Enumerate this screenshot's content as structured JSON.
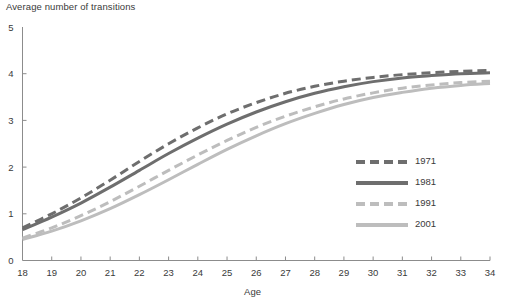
{
  "chart_data": {
    "type": "line",
    "title": "",
    "ylabel": "Average number of transitions",
    "xlabel": "Age",
    "xlim": [
      18,
      34
    ],
    "ylim": [
      0,
      5
    ],
    "grid": false,
    "legend_position": "right-middle",
    "x": [
      18,
      19,
      20,
      21,
      22,
      23,
      24,
      25,
      26,
      27,
      28,
      29,
      30,
      31,
      32,
      33,
      34
    ],
    "y_ticks": [
      "0",
      "1",
      "2",
      "3",
      "4",
      "5"
    ],
    "x_ticks": [
      "18",
      "19",
      "20",
      "21",
      "22",
      "23",
      "24",
      "25",
      "26",
      "27",
      "28",
      "29",
      "30",
      "31",
      "32",
      "33",
      "34"
    ],
    "series": [
      {
        "name": "1971",
        "style": "dashed",
        "color": "#6e6e6e",
        "values": [
          0.7,
          1.0,
          1.34,
          1.72,
          2.12,
          2.5,
          2.84,
          3.14,
          3.38,
          3.58,
          3.73,
          3.84,
          3.92,
          3.98,
          4.02,
          4.05,
          4.07
        ]
      },
      {
        "name": "1981",
        "style": "solid",
        "color": "#6e6e6e",
        "values": [
          0.66,
          0.93,
          1.23,
          1.57,
          1.93,
          2.29,
          2.62,
          2.92,
          3.18,
          3.4,
          3.58,
          3.72,
          3.83,
          3.91,
          3.96,
          4.0,
          4.02
        ]
      },
      {
        "name": "1991",
        "style": "dashed",
        "color": "#bdbdbd",
        "values": [
          0.48,
          0.7,
          0.96,
          1.26,
          1.59,
          1.93,
          2.26,
          2.57,
          2.85,
          3.09,
          3.29,
          3.46,
          3.59,
          3.69,
          3.76,
          3.81,
          3.84
        ]
      },
      {
        "name": "2001",
        "style": "solid",
        "color": "#bdbdbd",
        "values": [
          0.45,
          0.63,
          0.85,
          1.11,
          1.41,
          1.73,
          2.06,
          2.38,
          2.67,
          2.93,
          3.15,
          3.34,
          3.49,
          3.6,
          3.69,
          3.75,
          3.79
        ]
      }
    ]
  },
  "legend": {
    "items": [
      {
        "label": "1971",
        "color": "#6e6e6e",
        "style": "dashed"
      },
      {
        "label": "1981",
        "color": "#6e6e6e",
        "style": "solid"
      },
      {
        "label": "1991",
        "color": "#bdbdbd",
        "style": "dashed"
      },
      {
        "label": "2001",
        "color": "#bdbdbd",
        "style": "solid"
      }
    ]
  },
  "colors": {
    "dark_series": "#6e6e6e",
    "light_series": "#bdbdbd",
    "axis": "#8c8c8c",
    "text": "#3a3a3a",
    "background": "#ffffff"
  }
}
